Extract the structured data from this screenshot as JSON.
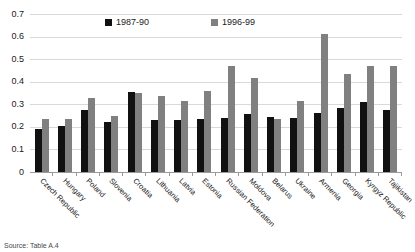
{
  "chart_data": {
    "type": "bar",
    "title": "",
    "subtitle": "",
    "xlabel": "",
    "ylabel": "",
    "ylim": [
      0,
      0.7
    ],
    "y_ticks": [
      "0",
      "0.1",
      "0.2",
      "0.3",
      "0.4",
      "0.5",
      "0.6",
      "0.7"
    ],
    "y_tick_values": [
      0,
      0.1,
      0.2,
      0.3,
      0.4,
      0.5,
      0.6,
      0.7
    ],
    "grid": true,
    "legend_position": "top-center",
    "categories": [
      "Czech Republic",
      "Hungary",
      "Poland",
      "Slovenia",
      "Croatia",
      "Lithuania",
      "Latvia",
      "Estonia",
      "Russian Federation",
      "Moldova",
      "Belarus",
      "Ukraine",
      "Armenia",
      "Georgia",
      "Kyrgyz Republic",
      "Tajikistan"
    ],
    "series": [
      {
        "name": "1987-90",
        "color": "#111111",
        "values": [
          0.19,
          0.205,
          0.275,
          0.22,
          0.355,
          0.23,
          0.23,
          0.235,
          0.24,
          0.255,
          0.245,
          0.24,
          0.26,
          0.285,
          0.31,
          0.275
        ]
      },
      {
        "name": "1996-99",
        "color": "#808080",
        "values": [
          0.235,
          0.235,
          0.33,
          0.25,
          0.35,
          0.335,
          0.315,
          0.36,
          0.47,
          0.415,
          0.235,
          0.315,
          0.61,
          0.435,
          0.47,
          0.47
        ]
      }
    ]
  },
  "source": {
    "note": "Source: Table A.4"
  }
}
